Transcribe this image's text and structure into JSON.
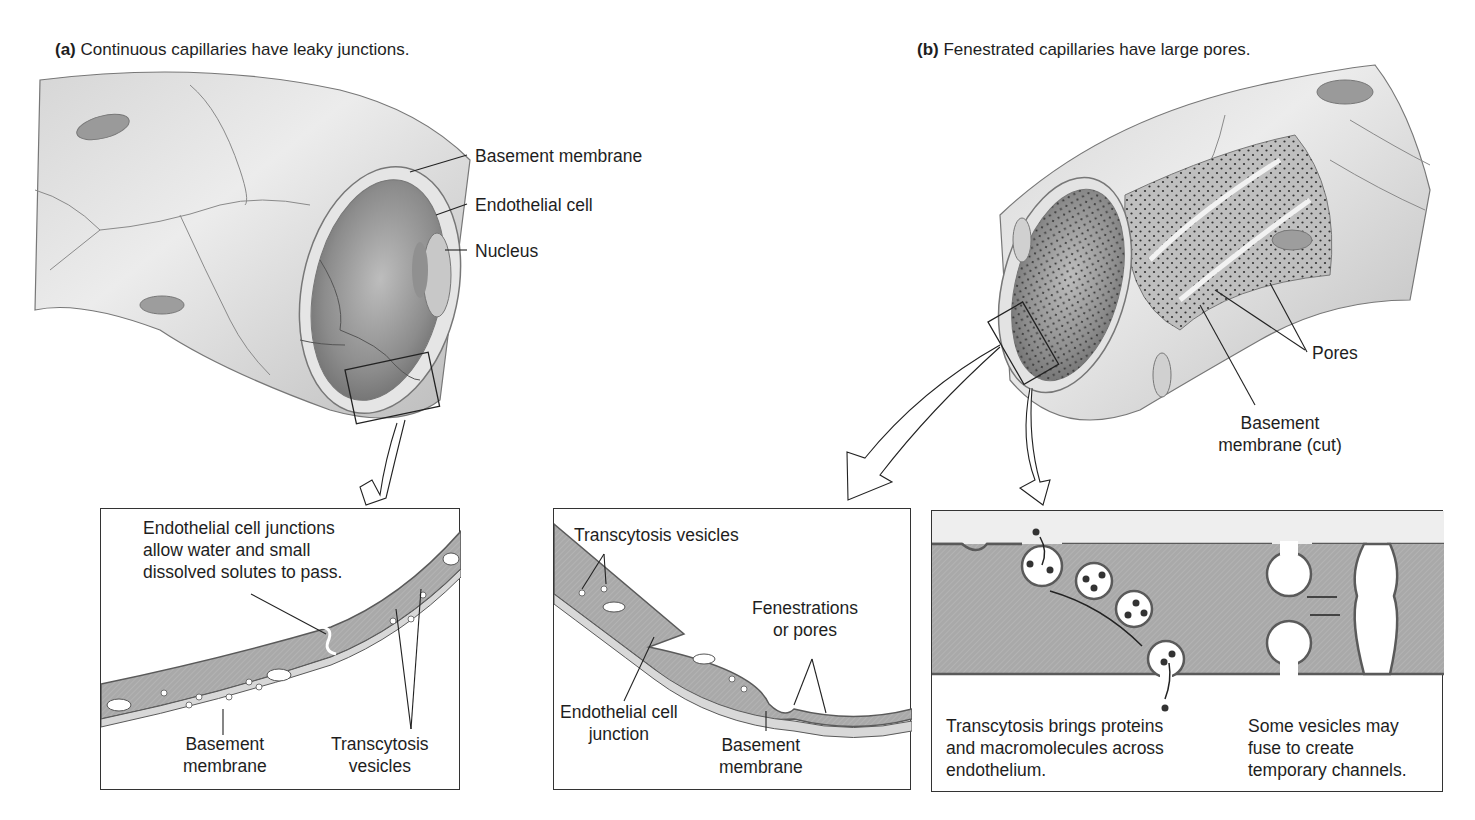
{
  "figure": {
    "panel_a": {
      "letter": "(a)",
      "title": "Continuous capillaries have leaky junctions.",
      "labels": {
        "basement_membrane": "Basement membrane",
        "endothelial_cell": "Endothelial cell",
        "nucleus": "Nucleus"
      },
      "detail": {
        "junction_note_line1": "Endothelial cell junctions",
        "junction_note_line2": "allow water and small",
        "junction_note_line3": "dissolved solutes to pass.",
        "basement_line1": "Basement",
        "basement_line2": "membrane",
        "vesicles_line1": "Transcytosis",
        "vesicles_line2": "vesicles"
      }
    },
    "panel_b": {
      "letter": "(b)",
      "title": "Fenestrated capillaries have large pores.",
      "labels": {
        "pores": "Pores",
        "basement_cut_line1": "Basement",
        "basement_cut_line2": "membrane (cut)"
      },
      "detail_left": {
        "vesicles": "Transcytosis vesicles",
        "fenestrations_line1": "Fenestrations",
        "fenestrations_line2": "or pores",
        "junction_line1": "Endothelial cell",
        "junction_line2": "junction",
        "basement_line1": "Basement",
        "basement_line2": "membrane"
      },
      "detail_right": {
        "transcytosis_line1": "Transcytosis brings proteins",
        "transcytosis_line2": "and macromolecules across",
        "transcytosis_line3": "endothelium.",
        "channels_line1": "Some vesicles may",
        "channels_line2": "fuse to create",
        "channels_line3": "temporary channels."
      }
    },
    "colors": {
      "cell_fill": "#a9a9a9",
      "cell_outline": "#5a5a5a",
      "vessel_light": "#e2e2e2",
      "vessel_mid": "#c4c4c4",
      "lumen_dark": "#8f8f8f",
      "line": "#222222"
    }
  }
}
